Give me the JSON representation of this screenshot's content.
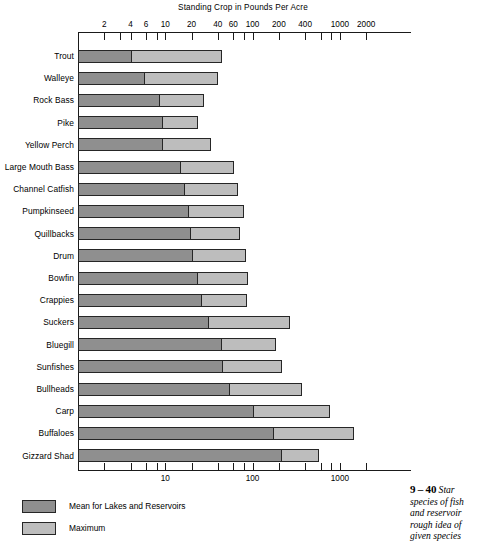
{
  "chart_data": {
    "type": "bar",
    "orientation": "horizontal",
    "title": "Standing Crop in Pounds Per Acre",
    "xlabel": "Standing Crop in Pounds Per Acre",
    "ylabel": "",
    "xscale": "log",
    "xlim": [
      1,
      3000
    ],
    "grid": false,
    "legend_position": "bottom-left",
    "top_axis_ticks": [
      {
        "value": 2,
        "label": "2"
      },
      {
        "value": 3,
        "label": ""
      },
      {
        "value": 4,
        "label": "4"
      },
      {
        "value": 6,
        "label": "6"
      },
      {
        "value": 8,
        "label": ""
      },
      {
        "value": 10,
        "label": "10"
      },
      {
        "value": 20,
        "label": "20"
      },
      {
        "value": 40,
        "label": "40"
      },
      {
        "value": 60,
        "label": "60"
      },
      {
        "value": 80,
        "label": ""
      },
      {
        "value": 100,
        "label": "100"
      },
      {
        "value": 200,
        "label": "200"
      },
      {
        "value": 400,
        "label": "400"
      },
      {
        "value": 600,
        "label": ""
      },
      {
        "value": 800,
        "label": ""
      },
      {
        "value": 1000,
        "label": "1000"
      },
      {
        "value": 2000,
        "label": "2000"
      }
    ],
    "bottom_axis_ticks": [
      {
        "value": 2,
        "label": ""
      },
      {
        "value": 4,
        "label": ""
      },
      {
        "value": 6,
        "label": ""
      },
      {
        "value": 8,
        "label": ""
      },
      {
        "value": 10,
        "label": "10"
      },
      {
        "value": 20,
        "label": ""
      },
      {
        "value": 40,
        "label": ""
      },
      {
        "value": 60,
        "label": ""
      },
      {
        "value": 80,
        "label": ""
      },
      {
        "value": 100,
        "label": "100"
      },
      {
        "value": 200,
        "label": ""
      },
      {
        "value": 400,
        "label": ""
      },
      {
        "value": 600,
        "label": ""
      },
      {
        "value": 800,
        "label": ""
      },
      {
        "value": 1000,
        "label": "1000"
      },
      {
        "value": 2000,
        "label": ""
      }
    ],
    "categories": [
      "Trout",
      "Walleye",
      "Rock Bass",
      "Pike",
      "Yellow Perch",
      "Large Mouth Bass",
      "Channel Catfish",
      "Pumpkinseed",
      "Quillbacks",
      "Drum",
      "Bowfin",
      "Crappies",
      "Suckers",
      "Bluegill",
      "Sunfishes",
      "Bullheads",
      "Carp",
      "Buffaloes",
      "Gizzard Shad"
    ],
    "series": [
      {
        "name": "Mean for Lakes and Reservoirs",
        "color": "#8f8f8f",
        "values": [
          4.2,
          5.8,
          8.6,
          9.3,
          9.5,
          15.3,
          17,
          18.5,
          19.7,
          20.5,
          23.5,
          26,
          31.5,
          45,
          46,
          55,
          105,
          175,
          215
        ]
      },
      {
        "name": "Maximum",
        "color": "#bdbdbd",
        "values": [
          45,
          40,
          28,
          24,
          33,
          62,
          68,
          80,
          71,
          85,
          89,
          86,
          270,
          185,
          215,
          370,
          770,
          1450,
          570
        ]
      }
    ]
  },
  "legend": {
    "items": [
      {
        "label": "Mean for Lakes and Reservoirs",
        "swatch": "mean"
      },
      {
        "label": "Maximum",
        "swatch": "max"
      }
    ]
  },
  "caption": {
    "number": "9 – 40",
    "lines": [
      "Star",
      "species of fish",
      "and reservoir",
      "rough idea of",
      "given species"
    ]
  },
  "colors": {
    "mean": "#8f8f8f",
    "maximum": "#bdbdbd",
    "outline": "#262626",
    "axis": "#1a1a1a",
    "background": "#ffffff"
  }
}
